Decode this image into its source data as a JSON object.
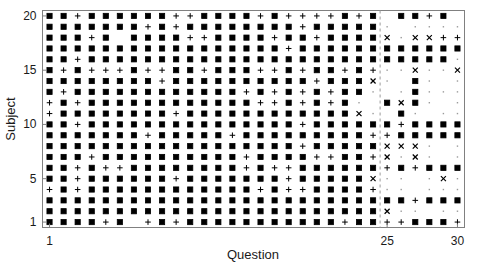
{
  "chart_data": {
    "type": "scatter",
    "title": "",
    "subtitle": "",
    "xlabel": "Question",
    "ylabel": "Subject",
    "xlim": [
      0.5,
      30.5
    ],
    "ylim": [
      0.5,
      20.5
    ],
    "xticks": [
      1,
      25,
      30
    ],
    "xticklabels": [
      "1",
      "25",
      "30"
    ],
    "yticks": [
      1,
      5,
      10,
      15,
      20
    ],
    "yticklabels": [
      "1",
      "5",
      "10",
      "15",
      "20"
    ],
    "grid": false,
    "legend": null,
    "legend_position": "none",
    "marker_color": "#000000",
    "axis_color": "#808080",
    "background": "#ffffff",
    "annotations": [
      {
        "name": "block-divider",
        "type": "vline",
        "x": 24.5,
        "style": "dashed",
        "color": "#9a9a9a"
      }
    ],
    "marker_types": {
      "s": "filled-square",
      "p": "plus",
      "x": "cross-x",
      "d": "small-dot"
    },
    "x_values": [
      1,
      2,
      3,
      4,
      5,
      6,
      7,
      8,
      9,
      10,
      11,
      12,
      13,
      14,
      15,
      16,
      17,
      18,
      19,
      20,
      21,
      22,
      23,
      24,
      25,
      26,
      27,
      28,
      29,
      30
    ],
    "y_values": [
      1,
      2,
      3,
      4,
      5,
      6,
      7,
      8,
      9,
      10,
      11,
      12,
      13,
      14,
      15,
      16,
      17,
      18,
      19,
      20
    ],
    "matrix_note": "rows listed from Subject 20 (top) down to Subject 1 (bottom); each string has 30 marker codes, one per Question 1..30",
    "matrix": [
      "sspssssssppsssspsppppsps ssps sd",
      "ssssssspspsssssssspsssssd ddddx",
      "sssps ssssppsssspsspssssxdxxpp",
      "ssssssssssssssssspssssssssssss",
      "sspssssssssssssssssssssssssssd",
      "spspppsppsspsssppspsspspddxddx",
      "sssssssspsssssssssspsssxd sd dx",
      "spsssssssssssspspspspssd dsddd",
      "pspssssssssssssppspspsd sxsd d",
      "psssssssspssssssssssssxd sd dd",
      "sspssssssssssssssspsssssspssssd",
      "ssssssspssssspsssssssssppssssss",
      "sssssssssssssssssspsssssxxxd dd",
      "ssspsssssssssspssssppsspxdxd dd",
      "sspsppsssssssspsppsssssspspssss",
      "sspsssssspssssssspsssssxdd dxd",
      "pspsssssssssssspsppsssspdd ddd",
      "sssssssssssssssssssssssssspssss",
      "ssssssssssssssssssssssssxdd dd",
      "ssssps pspssssssssssspssppsssp"
    ]
  },
  "figure": {
    "width": 480,
    "height": 271
  }
}
